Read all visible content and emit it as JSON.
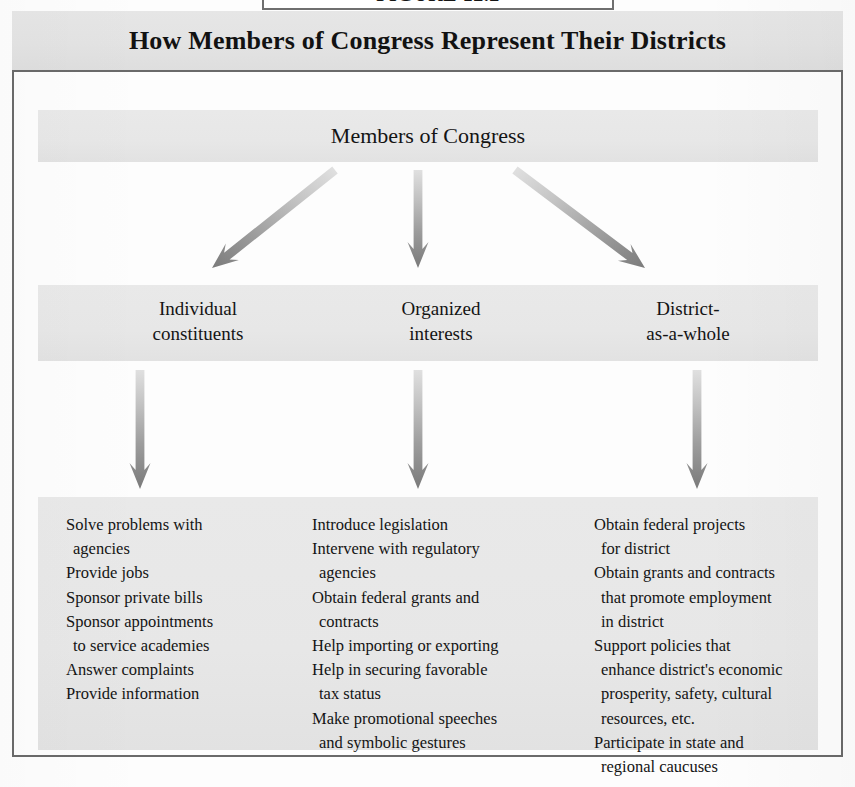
{
  "figure_label": {
    "text": "FIGURE 12.2",
    "visible_note": "cropped at top edge"
  },
  "title": "How Members of Congress Represent Their Districts",
  "diagram": {
    "root": {
      "label": "Members of Congress"
    },
    "categories": [
      {
        "id": "individual-constituents",
        "line1": "Individual",
        "line2": "constituents"
      },
      {
        "id": "organized-interests",
        "line1": "Organized",
        "line2": "interests"
      },
      {
        "id": "district-as-a-whole",
        "line1": "District-",
        "line2": "as-a-whole"
      }
    ],
    "activities": [
      {
        "id": "individual-constituents-activities",
        "items": [
          {
            "main": "Solve problems with",
            "cont": "agencies"
          },
          {
            "main": "Provide jobs",
            "cont": ""
          },
          {
            "main": "Sponsor private bills",
            "cont": ""
          },
          {
            "main": "Sponsor appointments",
            "cont": "to service academies"
          },
          {
            "main": "Answer complaints",
            "cont": ""
          },
          {
            "main": "Provide information",
            "cont": ""
          }
        ]
      },
      {
        "id": "organized-interests-activities",
        "items": [
          {
            "main": "Introduce legislation",
            "cont": ""
          },
          {
            "main": "Intervene with regulatory",
            "cont": "agencies"
          },
          {
            "main": "Obtain federal grants and",
            "cont": "contracts"
          },
          {
            "main": "Help importing or exporting",
            "cont": ""
          },
          {
            "main": "Help in securing favorable",
            "cont": "tax status"
          },
          {
            "main": "Make promotional speeches",
            "cont": "and symbolic gestures"
          }
        ]
      },
      {
        "id": "district-as-a-whole-activities",
        "items": [
          {
            "main": "Obtain federal projects",
            "cont": "for district"
          },
          {
            "main": "Obtain grants and contracts",
            "cont": "that promote employment|in district"
          },
          {
            "main": "Support policies that",
            "cont": "enhance district's economic|prosperity, safety, cultural|resources, etc."
          },
          {
            "main": "Participate in state and",
            "cont": "regional caucuses"
          }
        ]
      }
    ],
    "arrows": {
      "tier1": [
        {
          "id": "arrow-root-to-individual",
          "direction": "down-left",
          "from_x": 335,
          "from_y": 170,
          "to_x": 212,
          "to_y": 268
        },
        {
          "id": "arrow-root-to-organized",
          "direction": "down",
          "from_x": 418,
          "from_y": 170,
          "to_x": 418,
          "to_y": 268
        },
        {
          "id": "arrow-root-to-district",
          "direction": "down-right",
          "from_x": 515,
          "from_y": 170,
          "to_x": 645,
          "to_y": 268
        }
      ],
      "tier2": [
        {
          "id": "arrow-individual-to-list",
          "direction": "down",
          "from_x": 140,
          "from_y": 370,
          "to_x": 140,
          "to_y": 489
        },
        {
          "id": "arrow-organized-to-list",
          "direction": "down",
          "from_x": 418,
          "from_y": 370,
          "to_x": 418,
          "to_y": 489
        },
        {
          "id": "arrow-district-to-list",
          "direction": "down",
          "from_x": 697,
          "from_y": 370,
          "to_x": 697,
          "to_y": 489
        }
      ]
    }
  },
  "colors": {
    "band_gray": "#e7e7e7",
    "title_gray": "#e3e3e3",
    "frame_line": "#6a6a6a",
    "text": "#141414",
    "arrow_light": "#d8d8d8",
    "arrow_dark": "#7d7d7d",
    "page_white": "#fdfdfd"
  }
}
